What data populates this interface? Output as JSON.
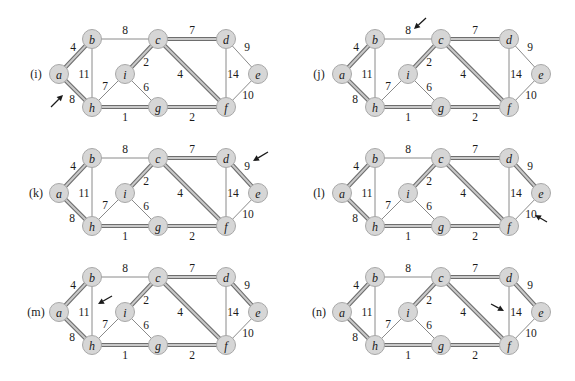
{
  "figure": {
    "node_color": "#d6d6d6",
    "mst_edge_color": "#c9c9c9",
    "edge_color": "#8a8a8a"
  },
  "graph": {
    "nodes": [
      {
        "id": "a",
        "x": 59,
        "y": 74
      },
      {
        "id": "b",
        "x": 92,
        "y": 39
      },
      {
        "id": "c",
        "x": 158,
        "y": 39
      },
      {
        "id": "d",
        "x": 226,
        "y": 39
      },
      {
        "id": "e",
        "x": 258,
        "y": 74
      },
      {
        "id": "f",
        "x": 226,
        "y": 107
      },
      {
        "id": "g",
        "x": 158,
        "y": 107
      },
      {
        "id": "h",
        "x": 92,
        "y": 107
      },
      {
        "id": "i",
        "x": 125,
        "y": 74
      }
    ],
    "edges": [
      {
        "u": "a",
        "v": "b",
        "w": "4",
        "lx": 73,
        "ly": 47
      },
      {
        "u": "a",
        "v": "h",
        "w": "8",
        "lx": 72,
        "ly": 99
      },
      {
        "u": "b",
        "v": "c",
        "w": "8",
        "lx": 125,
        "ly": 30
      },
      {
        "u": "b",
        "v": "h",
        "w": "11",
        "lx": 84,
        "ly": 74
      },
      {
        "u": "c",
        "v": "d",
        "w": "7",
        "lx": 192,
        "ly": 30
      },
      {
        "u": "c",
        "v": "i",
        "w": "2",
        "lx": 146,
        "ly": 62
      },
      {
        "u": "c",
        "v": "f",
        "w": "4",
        "lx": 180,
        "ly": 74
      },
      {
        "u": "d",
        "v": "e",
        "w": "9",
        "lx": 247,
        "ly": 47
      },
      {
        "u": "d",
        "v": "f",
        "w": "14",
        "lx": 233,
        "ly": 74
      },
      {
        "u": "e",
        "v": "f",
        "w": "10",
        "lx": 248,
        "ly": 95
      },
      {
        "u": "h",
        "v": "i",
        "w": "7",
        "lx": 105,
        "ly": 86
      },
      {
        "u": "i",
        "v": "g",
        "w": "6",
        "lx": 146,
        "ly": 87
      },
      {
        "u": "h",
        "v": "g",
        "w": "1",
        "lx": 125,
        "ly": 117
      },
      {
        "u": "g",
        "v": "f",
        "w": "2",
        "lx": 192,
        "ly": 117
      }
    ]
  },
  "panels": [
    {
      "label": "(i)",
      "dx": 0,
      "dy": 0,
      "mst": [
        "a-b",
        "a-h",
        "c-d",
        "c-i",
        "c-f",
        "h-g",
        "g-f"
      ],
      "arrow": {
        "x1": 51,
        "y1": 107,
        "x2": 63,
        "y2": 95
      }
    },
    {
      "label": "(j)",
      "dx": 283,
      "dy": 0,
      "mst": [
        "a-b",
        "a-h",
        "c-d",
        "c-i",
        "c-f",
        "h-g",
        "g-f"
      ],
      "arrow": {
        "x1": 143,
        "y1": 18,
        "x2": 131,
        "y2": 29
      }
    },
    {
      "label": "(k)",
      "dx": 0,
      "dy": 119,
      "mst": [
        "a-b",
        "a-h",
        "c-d",
        "c-i",
        "c-f",
        "h-g",
        "g-f",
        "d-e"
      ],
      "arrow": {
        "x1": 268,
        "y1": 33,
        "x2": 253,
        "y2": 42
      }
    },
    {
      "label": "(l)",
      "dx": 283,
      "dy": 119,
      "mst": [
        "a-b",
        "a-h",
        "c-d",
        "c-i",
        "c-f",
        "h-g",
        "g-f",
        "d-e"
      ],
      "arrow": {
        "x1": 264,
        "y1": 103,
        "x2": 252,
        "y2": 96
      }
    },
    {
      "label": "(m)",
      "dx": 0,
      "dy": 238,
      "mst": [
        "a-b",
        "a-h",
        "c-d",
        "c-i",
        "c-f",
        "h-g",
        "g-f",
        "d-e"
      ],
      "arrow": {
        "x1": 112,
        "y1": 58,
        "x2": 98,
        "y2": 66
      }
    },
    {
      "label": "(n)",
      "dx": 283,
      "dy": 238,
      "mst": [
        "a-b",
        "a-h",
        "c-d",
        "c-i",
        "c-f",
        "h-g",
        "g-f",
        "d-e"
      ],
      "arrow": {
        "x1": 208,
        "y1": 66,
        "x2": 221,
        "y2": 73
      }
    }
  ]
}
